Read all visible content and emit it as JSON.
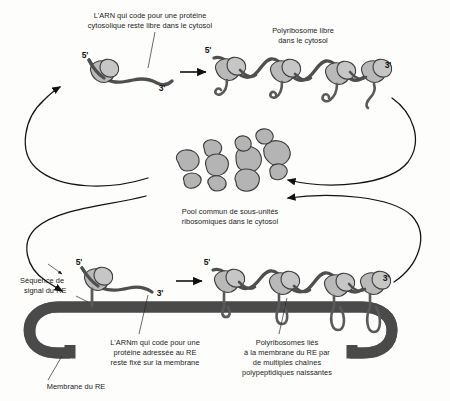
{
  "figure": {
    "background_color": "#fdfdfc",
    "ribosome_fill": "#b9b9b9",
    "membrane_color": "#4a4a4a",
    "rna_color": "#4f4f4f",
    "line_color": "#111111"
  },
  "captions": {
    "free_mrna": {
      "line1": "L'ARN qui code pour une protéine",
      "line2": "cytosolique reste libre dans le cytosol"
    },
    "free_polyribosome": {
      "line1": "Polyribosome libre",
      "line2": "dans le cytosol"
    },
    "pool": {
      "line1": "Pool commun de sous-unités",
      "line2": "ribosomiques dans le cytosol"
    },
    "signal_sequence": {
      "line1": "Séquence de",
      "line2": "signal du RE"
    },
    "er_mrna": {
      "line1": "L'ARNm qui code pour une",
      "line2": "protéine adressée au RE",
      "line3": "reste fixé sur la membrane"
    },
    "bound_polyribosomes": {
      "line1": "Polyribosomes liés",
      "line2": "à la membrane du RE par",
      "line3": "de multiples chaînes",
      "line4": "polypeptidiques naissantes"
    },
    "membrane": {
      "line1": "Membrane du RE"
    }
  },
  "prime_labels": {
    "top_single_5": "5'",
    "top_single_3": "3'",
    "top_poly_5": "5'",
    "top_poly_3": "3'",
    "bottom_single_5": "5'",
    "bottom_single_3": "3'",
    "bottom_poly_5": "5'",
    "bottom_poly_3": "3'"
  },
  "structures": {
    "free_ribosome_count": 1,
    "free_polyribosome_ribosome_count": 4,
    "bound_ribosome_count": 1,
    "bound_polyribosome_ribosome_count": 4,
    "pool_subunit_count": 11
  }
}
